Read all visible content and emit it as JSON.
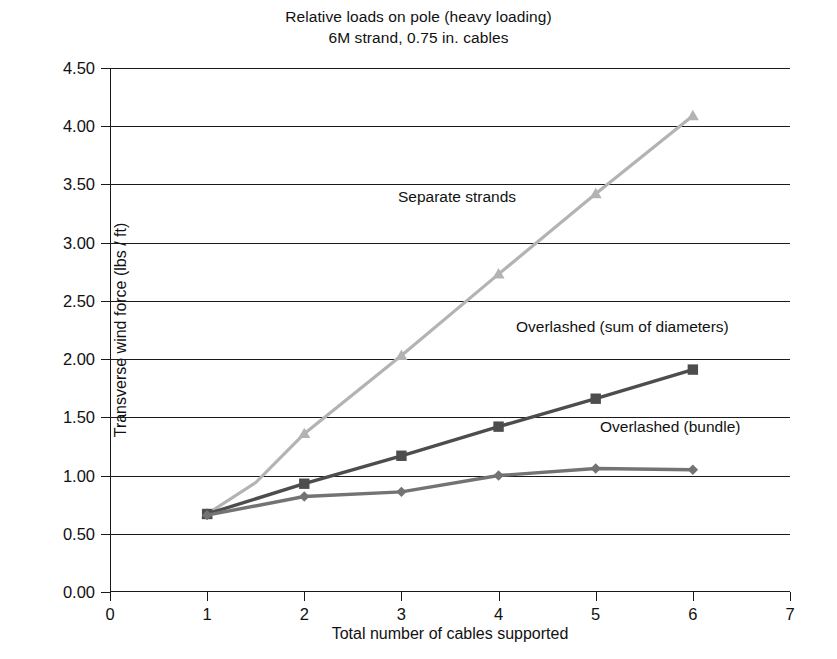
{
  "chart_data": {
    "type": "line",
    "title": "Relative loads on pole (heavy loading)",
    "subtitle": "6M strand, 0.75 in. cables",
    "xlabel": "Total number of cables supported",
    "ylabel": "Transverse wind force (lbs / ft)",
    "xlim": [
      0,
      7
    ],
    "ylim": [
      0.0,
      4.5
    ],
    "xticks": [
      "0",
      "1",
      "2",
      "3",
      "4",
      "5",
      "6",
      "7"
    ],
    "xtick_values": [
      0,
      1,
      2,
      3,
      4,
      5,
      6,
      7
    ],
    "yticks": [
      "0.00",
      "0.50",
      "1.00",
      "1.50",
      "2.00",
      "2.50",
      "3.00",
      "3.50",
      "4.00",
      "4.50"
    ],
    "ytick_values": [
      0.0,
      0.5,
      1.0,
      1.5,
      2.0,
      2.5,
      3.0,
      3.5,
      4.0,
      4.5
    ],
    "grid": "horizontal",
    "legend_position": "inline-annotations",
    "x": [
      1,
      2,
      3,
      4,
      5,
      6
    ],
    "series": [
      {
        "name": "Separate strands",
        "marker": "triangle",
        "color": "#b3b3b3",
        "values": [
          0.67,
          0.94,
          1.36,
          2.03,
          2.73,
          3.42,
          4.09
        ],
        "x_values": [
          1,
          1.5,
          2,
          3,
          4,
          5,
          6
        ]
      },
      {
        "name": "Overlashed (sum of diameters)",
        "marker": "square",
        "color": "#4d4d4d",
        "values": [
          0.67,
          0.93,
          1.17,
          1.42,
          1.66,
          1.91
        ]
      },
      {
        "name": "Overlashed (bundle)",
        "marker": "diamond",
        "color": "#737373",
        "values": [
          0.66,
          0.82,
          0.86,
          1.0,
          1.06,
          1.05
        ]
      }
    ],
    "annotations": [
      {
        "text": "Separate strands",
        "x_px": 398,
        "y_px": 188
      },
      {
        "text": "Overlashed (sum of diameters)",
        "x_px": 516,
        "y_px": 318
      },
      {
        "text": "Overlashed (bundle)",
        "x_px": 600,
        "y_px": 418
      }
    ]
  }
}
